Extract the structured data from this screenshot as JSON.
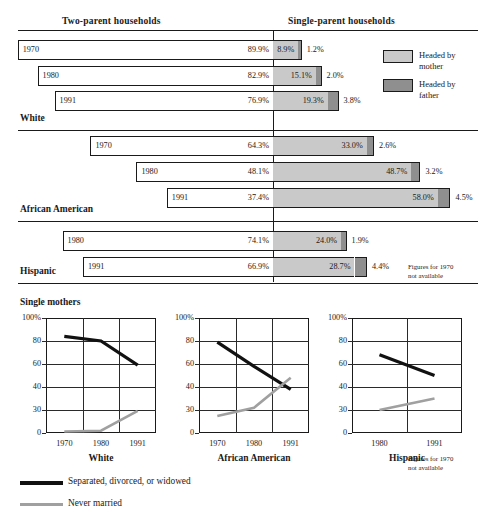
{
  "headers": {
    "two_parent": "Two-parent households",
    "single_parent": "Single-parent households"
  },
  "legend": {
    "mother_label_line1": "Headed by",
    "mother_label_line2": "mother",
    "father_label_line1": "Headed by",
    "father_label_line2": "father",
    "mother_color": "#c9c9c9",
    "father_color": "#8f8f8f"
  },
  "notes": {
    "hispanic_note_line1": "Figures for 1970",
    "hispanic_note_line2": "not available",
    "chart_note_line1": "Figures for 1970",
    "chart_note_line2": "not available"
  },
  "groups": [
    {
      "name": "White",
      "rows": [
        {
          "year": "1970",
          "two_parent": "89.9%",
          "mother": "8.9%",
          "father": "1.2%",
          "two_parent_v": 89.9,
          "mother_v": 8.9,
          "father_v": 1.2
        },
        {
          "year": "1980",
          "two_parent": "82.9%",
          "mother": "15.1%",
          "father": "2.0%",
          "two_parent_v": 82.9,
          "mother_v": 15.1,
          "father_v": 2.0
        },
        {
          "year": "1991",
          "two_parent": "76.9%",
          "mother": "19.3%",
          "father": "3.8%",
          "two_parent_v": 76.9,
          "mother_v": 19.3,
          "father_v": 3.8
        }
      ]
    },
    {
      "name": "African American",
      "rows": [
        {
          "year": "1970",
          "two_parent": "64.3%",
          "mother": "33.0%",
          "father": "2.6%",
          "two_parent_v": 64.3,
          "mother_v": 33.0,
          "father_v": 2.6
        },
        {
          "year": "1980",
          "two_parent": "48.1%",
          "mother": "48.7%",
          "father": "3.2%",
          "two_parent_v": 48.1,
          "mother_v": 48.7,
          "father_v": 3.2
        },
        {
          "year": "1991",
          "two_parent": "37.4%",
          "mother": "58.0%",
          "father": "4.5%",
          "two_parent_v": 37.4,
          "mother_v": 58.0,
          "father_v": 4.5
        }
      ]
    },
    {
      "name": "Hispanic",
      "rows": [
        {
          "year": "1980",
          "two_parent": "74.1%",
          "mother": "24.0%",
          "father": "1.9%",
          "two_parent_v": 74.1,
          "mother_v": 24.0,
          "father_v": 1.9
        },
        {
          "year": "1991",
          "two_parent": "66.9%",
          "mother": "28.7%",
          "father": "4.4%",
          "two_parent_v": 66.9,
          "mother_v": 28.7,
          "father_v": 4.4
        }
      ]
    }
  ],
  "single_mothers": {
    "title": "Single mothers",
    "legend": [
      {
        "label": "Separated, divorced, or widowed",
        "color": "#111111"
      },
      {
        "label": "Never married",
        "color": "#a0a0a0"
      }
    ]
  },
  "chart_data": [
    {
      "type": "line",
      "title": "White",
      "xlabel": "",
      "ylabel": "",
      "x": [
        "1970",
        "1980",
        "1991"
      ],
      "yticks": [
        "0",
        "30",
        "40",
        "60",
        "80",
        "100%"
      ],
      "ytick_values": [
        0,
        30,
        40,
        60,
        80,
        100
      ],
      "ylim": [
        0,
        100
      ],
      "grid": true,
      "series": [
        {
          "name": "Separated, divorced, or widowed",
          "values": [
            84,
            80,
            59
          ],
          "color": "#111111"
        },
        {
          "name": "Never married",
          "values": [
            2,
            3,
            29
          ],
          "color": "#a0a0a0"
        }
      ]
    },
    {
      "type": "line",
      "title": "African American",
      "xlabel": "",
      "ylabel": "",
      "x": [
        "1970",
        "1980",
        "1991"
      ],
      "yticks": [
        "0",
        "30",
        "40",
        "60",
        "80",
        "100%"
      ],
      "ytick_values": [
        0,
        30,
        40,
        60,
        80,
        100
      ],
      "ylim": [
        0,
        100
      ],
      "grid": true,
      "series": [
        {
          "name": "Separated, divorced, or widowed",
          "values": [
            79,
            58,
            39
          ],
          "color": "#111111"
        },
        {
          "name": "Never married",
          "values": [
            22,
            31,
            48
          ],
          "color": "#a0a0a0"
        }
      ]
    },
    {
      "type": "line",
      "title": "Hispanic",
      "xlabel": "",
      "ylabel": "",
      "x": [
        "1980",
        "1991"
      ],
      "yticks": [
        "0",
        "30",
        "40",
        "60",
        "80",
        "100%"
      ],
      "ytick_values": [
        0,
        30,
        40,
        60,
        80,
        100
      ],
      "ylim": [
        0,
        100
      ],
      "grid": true,
      "series": [
        {
          "name": "Separated, divorced, or widowed",
          "values": [
            68,
            50
          ],
          "color": "#111111"
        },
        {
          "name": "Never married",
          "values": [
            30,
            35
          ],
          "color": "#a0a0a0"
        }
      ]
    }
  ]
}
